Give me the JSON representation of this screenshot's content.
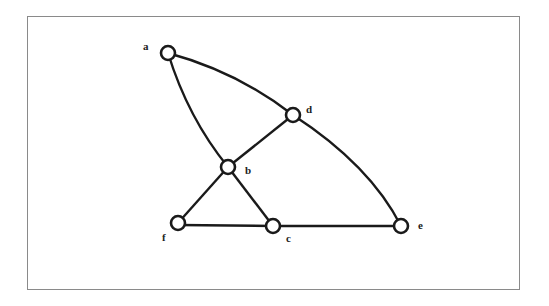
{
  "diagram": {
    "type": "graph",
    "nodes": [
      {
        "id": "a",
        "label": "a",
        "x": 168,
        "y": 53
      },
      {
        "id": "d",
        "label": "d",
        "x": 293,
        "y": 115
      },
      {
        "id": "b",
        "label": "b",
        "x": 228,
        "y": 167
      },
      {
        "id": "f",
        "label": "f",
        "x": 178,
        "y": 223
      },
      {
        "id": "c",
        "label": "c",
        "x": 273,
        "y": 226
      },
      {
        "id": "e",
        "label": "e",
        "x": 401,
        "y": 226
      }
    ],
    "edges": [
      {
        "from": "a",
        "to": "d",
        "curved": true
      },
      {
        "from": "d",
        "to": "e",
        "curved": true
      },
      {
        "from": "a",
        "to": "b",
        "curved": true
      },
      {
        "from": "b",
        "to": "c"
      },
      {
        "from": "d",
        "to": "b"
      },
      {
        "from": "b",
        "to": "f"
      },
      {
        "from": "f",
        "to": "c"
      },
      {
        "from": "c",
        "to": "e"
      }
    ],
    "colors": {
      "stroke": "#1a1a1a",
      "frame": "#8a8a8a",
      "background": "#ffffff"
    }
  }
}
